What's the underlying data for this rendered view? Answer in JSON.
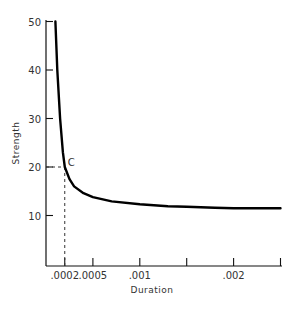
{
  "chart_data": {
    "type": "line",
    "title": "",
    "xlabel": "Duration",
    "ylabel": "Strength",
    "xlim": [
      0,
      0.0025
    ],
    "ylim": [
      0,
      50
    ],
    "grid": false,
    "legend": null,
    "x_ticks": [
      {
        "value": 0.0002,
        "label": ".0002"
      },
      {
        "value": 0.0005,
        "label": ".0005"
      },
      {
        "value": 0.001,
        "label": ".001"
      },
      {
        "value": 0.0015,
        "label": ""
      },
      {
        "value": 0.002,
        "label": ".002"
      },
      {
        "value": 0.0025,
        "label": ""
      }
    ],
    "y_ticks": [
      {
        "value": 10,
        "label": "10"
      },
      {
        "value": 20,
        "label": "20"
      },
      {
        "value": 30,
        "label": "30"
      },
      {
        "value": 40,
        "label": "40"
      },
      {
        "value": 50,
        "label": "50"
      }
    ],
    "series": [
      {
        "name": "Strength-Duration curve",
        "x": [
          0.0001,
          0.00012,
          0.00015,
          0.00018,
          0.0002,
          0.00025,
          0.0003,
          0.0004,
          0.0005,
          0.0007,
          0.001,
          0.0013,
          0.0015,
          0.0018,
          0.002,
          0.0025
        ],
        "y": [
          50,
          40,
          30,
          23,
          20,
          17.5,
          16,
          14.6,
          13.8,
          12.9,
          12.3,
          11.9,
          11.8,
          11.6,
          11.5,
          11.5
        ]
      }
    ],
    "annotations": [
      {
        "label": "C",
        "x": 0.0002,
        "y": 20,
        "note": "dashed reference lines to both axes"
      }
    ]
  }
}
